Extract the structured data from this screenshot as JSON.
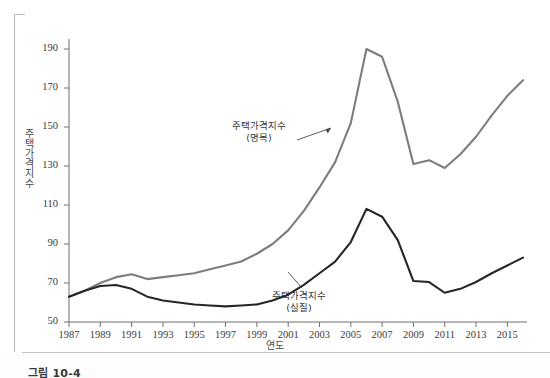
{
  "figure": {
    "caption": "그림 10-4"
  },
  "axes": {
    "y_title": "주택가격지수",
    "x_title": "연도",
    "y_ticks": [
      50,
      70,
      90,
      110,
      130,
      150,
      170,
      190
    ],
    "x_ticks": [
      1987,
      1989,
      1991,
      1993,
      1995,
      1997,
      1999,
      2001,
      2003,
      2005,
      2007,
      2009,
      2011,
      2013,
      2015
    ]
  },
  "annotations": {
    "nominal": {
      "line1": "주택가격지수",
      "line2": "(명목)"
    },
    "real": {
      "line1": "주택가격지수",
      "line2": "(실질)"
    }
  },
  "colors": {
    "nominal_line": "#7d7d7d",
    "real_line": "#262626",
    "axis": "#6f6f6f",
    "text": "#3b3b3b",
    "background": "#ffffff"
  },
  "chart_data": {
    "type": "line",
    "title": "",
    "xlabel": "연도",
    "ylabel": "주택가격지수",
    "xlim": [
      1987,
      2016
    ],
    "ylim": [
      50,
      190
    ],
    "grid": false,
    "legend": "annotations-inline",
    "x": [
      1987,
      1988,
      1989,
      1990,
      1991,
      1992,
      1993,
      1994,
      1995,
      1996,
      1997,
      1998,
      1999,
      2000,
      2001,
      2002,
      2003,
      2004,
      2005,
      2006,
      2007,
      2008,
      2009,
      2010,
      2011,
      2012,
      2013,
      2014,
      2015,
      2016
    ],
    "series": [
      {
        "name": "주택가격지수 (명목)",
        "color": "#7d7d7d",
        "values": [
          63,
          66,
          70,
          73,
          74.5,
          72,
          73,
          74,
          75,
          77,
          79,
          81,
          85,
          90,
          97,
          107,
          119,
          132,
          152,
          190,
          186,
          163,
          131,
          133,
          129,
          136,
          145,
          156,
          166,
          174
        ]
      },
      {
        "name": "주택가격지수 (실질)",
        "color": "#262626",
        "values": [
          63,
          66,
          68.5,
          69,
          67,
          63,
          61,
          60,
          59,
          58.5,
          58,
          58.5,
          59,
          61,
          64,
          69,
          75,
          81,
          91,
          108,
          104,
          92,
          71,
          70.5,
          65,
          67,
          70.5,
          75,
          79,
          83
        ]
      }
    ]
  }
}
